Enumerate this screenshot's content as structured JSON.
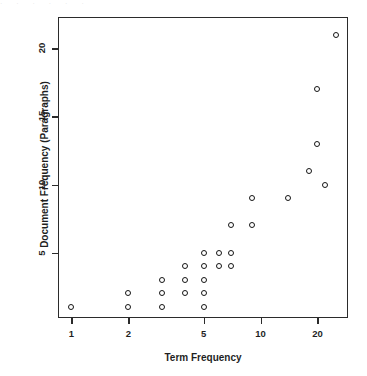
{
  "figure": {
    "background": "#ffffff",
    "frame_color": "#2b2b2b",
    "marker_color": "#151515",
    "top_bleed_text": "·     ·          ·    ·     · ·"
  },
  "chart_data": {
    "type": "scatter",
    "title": "",
    "xlabel": "Term Frequency",
    "ylabel": "Document Frequency (Paragraphs)",
    "xscale": "log",
    "yscale": "linear",
    "xlim": [
      0.85,
      29
    ],
    "ylim": [
      0.2,
      22.3
    ],
    "xticks": [
      1,
      2,
      5,
      10,
      20
    ],
    "xticklabels": [
      "1",
      "2",
      "5",
      "10",
      "20"
    ],
    "yticks": [
      5,
      10,
      15,
      20
    ],
    "yticklabels": [
      "5",
      "10",
      "15",
      "20"
    ],
    "grid": false,
    "legend": false,
    "marker": "open-circle",
    "series": [
      {
        "name": "terms",
        "x": [
          1,
          2,
          2,
          3,
          3,
          3,
          4,
          4,
          4,
          4,
          5,
          5,
          5,
          5,
          5,
          6,
          6,
          6,
          7,
          7,
          7,
          7,
          9,
          9,
          10,
          14,
          18,
          20,
          20,
          22,
          25
        ],
        "y": [
          1,
          1,
          2,
          1,
          2,
          3,
          2,
          3,
          4,
          5,
          1,
          2,
          3,
          4,
          5,
          4,
          5,
          7,
          4,
          5,
          7,
          9,
          7,
          9,
          9,
          9,
          11,
          13,
          17,
          10,
          21
        ]
      }
    ],
    "points": [
      {
        "x": 1,
        "y": 1
      },
      {
        "x": 2,
        "y": 1
      },
      {
        "x": 2,
        "y": 2
      },
      {
        "x": 3,
        "y": 1
      },
      {
        "x": 3,
        "y": 2
      },
      {
        "x": 3,
        "y": 3
      },
      {
        "x": 4,
        "y": 2
      },
      {
        "x": 4,
        "y": 3
      },
      {
        "x": 4,
        "y": 4
      },
      {
        "x": 5,
        "y": 1
      },
      {
        "x": 5,
        "y": 2
      },
      {
        "x": 5,
        "y": 3
      },
      {
        "x": 5,
        "y": 4
      },
      {
        "x": 5,
        "y": 5
      },
      {
        "x": 6,
        "y": 4
      },
      {
        "x": 6,
        "y": 5
      },
      {
        "x": 7,
        "y": 4
      },
      {
        "x": 7,
        "y": 5
      },
      {
        "x": 7,
        "y": 7
      },
      {
        "x": 9,
        "y": 7
      },
      {
        "x": 9,
        "y": 9
      },
      {
        "x": 14,
        "y": 9
      },
      {
        "x": 18,
        "y": 11
      },
      {
        "x": 20,
        "y": 13
      },
      {
        "x": 20,
        "y": 17
      },
      {
        "x": 22,
        "y": 10
      },
      {
        "x": 25,
        "y": 21
      }
    ]
  }
}
